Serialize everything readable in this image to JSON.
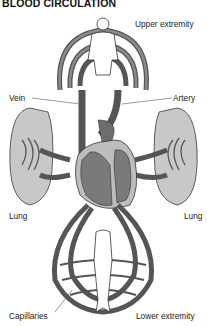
{
  "title": "BLOOD CIRCULATION",
  "labels": {
    "upper": "Upper extremity",
    "vein": "Vein",
    "artery": "Artery",
    "lung_left": "Lung",
    "lung_right": "Lung",
    "capillaries": "Capillaries",
    "lower": "Lower extremity"
  },
  "colors": {
    "vessel": "#6e6e6e",
    "vessel_outline": "#3a3a3a",
    "lung_fill": "#c8c8c8",
    "heart_fill": "#7a7a7a",
    "heart_wall": "#bdbdbd",
    "body_fill": "#ffffff"
  }
}
